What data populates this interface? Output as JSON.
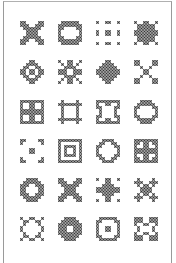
{
  "page": {
    "stitch_color": "#333333",
    "background": "#ffffff",
    "border_color": "#9a9a9a"
  },
  "grid": {
    "columns": 4,
    "rows": 6,
    "col_centers": [
      32,
      70,
      108,
      146
    ],
    "row_centers": [
      33,
      72,
      112,
      151,
      190,
      229
    ]
  },
  "motifs": [
    {
      "name": "x-cross-solid",
      "pattern": [
        "11000011",
        "11100111",
        "01111110",
        "00111100",
        "00111100",
        "01111110",
        "11100111",
        "11000011"
      ]
    },
    {
      "name": "square-ring-round",
      "pattern": [
        "01111110",
        "11111111",
        "11000011",
        "10000001",
        "10000001",
        "11000011",
        "11111111",
        "01111110"
      ]
    },
    {
      "name": "dotted-3x3-grid",
      "pattern": [
        "10011001",
        "00000000",
        "00000000",
        "10011001",
        "10011001",
        "00000000",
        "00000000",
        "10011001"
      ]
    },
    {
      "name": "star-solid",
      "pattern": [
        "10011001",
        "01111110",
        "01111110",
        "11111111",
        "11111111",
        "01111110",
        "01111110",
        "10011001"
      ]
    },
    {
      "name": "ring-with-center",
      "pattern": [
        "00011000",
        "00111100",
        "01100110",
        "11011011",
        "11011011",
        "01100110",
        "00111100",
        "00011000"
      ]
    },
    {
      "name": "open-x-diamond",
      "pattern": [
        "10011001",
        "01011010",
        "00111100",
        "11100111",
        "11100111",
        "00111100",
        "01011010",
        "10011001"
      ]
    },
    {
      "name": "diamond-solid",
      "pattern": [
        "00011000",
        "00111100",
        "01111110",
        "11111111",
        "11111111",
        "01111110",
        "00111100",
        "00011000"
      ]
    },
    {
      "name": "four-corner-x",
      "pattern": [
        "11000011",
        "11000011",
        "00100100",
        "00011000",
        "00011000",
        "00100100",
        "11000011",
        "11000011"
      ]
    },
    {
      "name": "square-four-holes",
      "pattern": [
        "11111111",
        "10011001",
        "10011001",
        "11111111",
        "11111111",
        "10011001",
        "10011001",
        "11111111"
      ]
    },
    {
      "name": "hash-frame",
      "pattern": [
        "01000010",
        "11111111",
        "01000010",
        "01000010",
        "01000010",
        "01000010",
        "11111111",
        "01000010"
      ]
    },
    {
      "name": "square-corner-dots",
      "pattern": [
        "11111111",
        "10011001",
        "11000011",
        "01000010",
        "01000010",
        "11000011",
        "10011001",
        "11111111"
      ]
    },
    {
      "name": "circle-ring",
      "pattern": [
        "00111100",
        "01111110",
        "11000011",
        "10000001",
        "10000001",
        "11000011",
        "01111110",
        "00111100"
      ]
    },
    {
      "name": "corner-brackets-dot",
      "pattern": [
        "11000011",
        "10000001",
        "00000000",
        "00011000",
        "00011000",
        "00000000",
        "10000001",
        "11000011"
      ]
    },
    {
      "name": "double-square",
      "pattern": [
        "11111111",
        "10000001",
        "10111101",
        "10100101",
        "10100101",
        "10111101",
        "10000001",
        "11111111"
      ]
    },
    {
      "name": "octagon-ring",
      "pattern": [
        "00111100",
        "01100110",
        "11000011",
        "10000001",
        "10000001",
        "11000011",
        "01100110",
        "00111100"
      ]
    },
    {
      "name": "checker-square",
      "pattern": [
        "11111111",
        "11011011",
        "10011001",
        "11111111",
        "11111111",
        "10011001",
        "11011011",
        "11111111"
      ]
    },
    {
      "name": "round-ring-thick",
      "pattern": [
        "00111100",
        "01111110",
        "11100111",
        "11000011",
        "11000011",
        "11100111",
        "01111110",
        "00111100"
      ]
    },
    {
      "name": "x-with-center",
      "pattern": [
        "11000011",
        "11100111",
        "01111110",
        "00111100",
        "00111100",
        "01111110",
        "11100111",
        "11000011"
      ]
    },
    {
      "name": "plus-cross",
      "pattern": [
        "10011001",
        "00011000",
        "00111100",
        "11111111",
        "11111111",
        "00111100",
        "00011000",
        "10011001"
      ]
    },
    {
      "name": "snowflake",
      "pattern": [
        "01000010",
        "11100111",
        "01011010",
        "00111100",
        "00111100",
        "01011010",
        "11100111",
        "01000010"
      ]
    },
    {
      "name": "open-octagon-x",
      "pattern": [
        "10011001",
        "01100110",
        "01000010",
        "10000001",
        "10000001",
        "01000010",
        "01100110",
        "10011001"
      ]
    },
    {
      "name": "thick-ring",
      "pattern": [
        "00111100",
        "01111110",
        "11111111",
        "11100111",
        "11100111",
        "11111111",
        "01111110",
        "00111100"
      ]
    },
    {
      "name": "square-inner-square",
      "pattern": [
        "01111110",
        "11000011",
        "10000001",
        "10011001",
        "10011001",
        "10000001",
        "11000011",
        "01111110"
      ]
    },
    {
      "name": "square-corner-blocks",
      "pattern": [
        "11100111",
        "11100111",
        "10011001",
        "01000010",
        "01000010",
        "10011001",
        "11100111",
        "11100111"
      ]
    }
  ]
}
